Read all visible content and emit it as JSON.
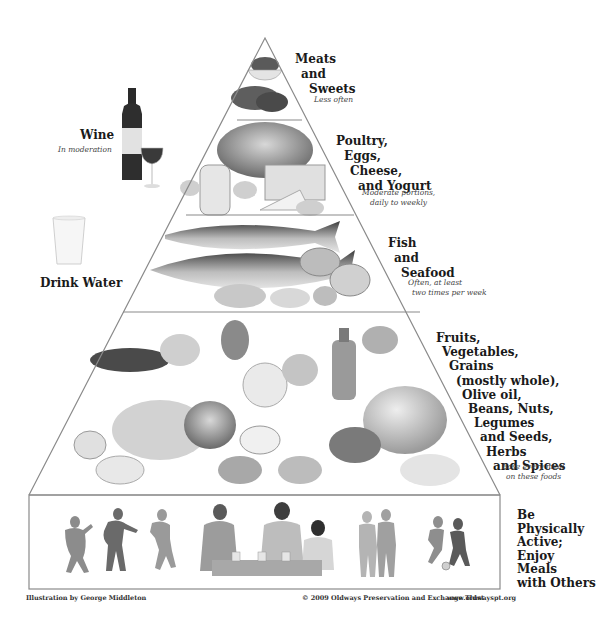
{
  "diagram": {
    "type": "food-pyramid",
    "tiers": [
      {
        "id": "meats-sweets",
        "lines": [
          "Meats",
          "and",
          "Sweets"
        ],
        "frequency": "Less often",
        "illustration": "bowl of sweets and red meat cuts"
      },
      {
        "id": "poultry-eggs-cheese-yogurt",
        "lines": [
          "Poultry,",
          "Eggs,",
          "Cheese,",
          "and Yogurt"
        ],
        "frequency_lines": [
          "Moderate portions,",
          "daily to weekly"
        ],
        "illustration": "roast chicken, eggs, yogurt jar, cheese wedges"
      },
      {
        "id": "fish-seafood",
        "lines": [
          "Fish",
          "and",
          "Seafood"
        ],
        "frequency_lines": [
          "Often, at least",
          "two times per week"
        ],
        "illustration": "whole fish, shrimp, clams, shellfish"
      },
      {
        "id": "plant-foods",
        "lines": [
          "Fruits,",
          "Vegetables,",
          "Grains",
          "(mostly whole),",
          "Olive oil,",
          "Beans, Nuts,",
          "Legumes",
          "and Seeds,",
          "Herbs",
          "and Spices"
        ],
        "frequency_lines": [
          "Base every meal",
          "on these foods"
        ],
        "illustration": "fruits, vegetables, bread, olive oil bottle, grapes, garlic, grains"
      },
      {
        "id": "activity",
        "lines": [
          "Be",
          "Physically",
          "Active;",
          "Enjoy",
          "Meals",
          "with Others"
        ],
        "illustration": "people dancing, sharing a meal, walking, playing soccer"
      }
    ],
    "side_items": [
      {
        "id": "wine",
        "label": "Wine",
        "note": "In moderation",
        "illustration": "wine bottle and glass"
      },
      {
        "id": "water",
        "label": "Drink Water",
        "illustration": "glass of water"
      }
    ],
    "footer": {
      "credit": "Illustration by George Middleton",
      "copyright": "© 2009 Oldways Preservation and Exchange Trust",
      "website": "www.oldwayspt.org"
    },
    "colors": {
      "outline": "#8a8a8a",
      "text": "#1a1a1a",
      "note_text": "#444444",
      "background": "#ffffff"
    }
  }
}
